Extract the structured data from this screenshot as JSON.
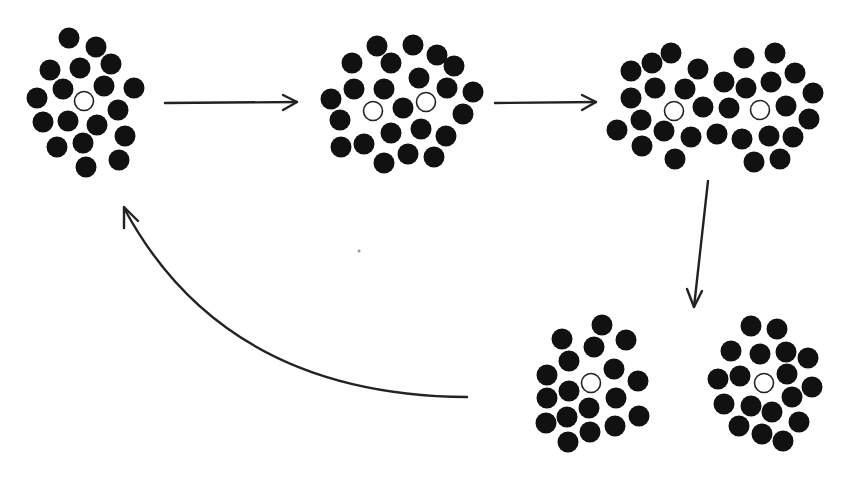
{
  "diagram": {
    "colors": {
      "particle": "#111111",
      "hole": "#ffffff",
      "stroke": "#222222",
      "background": "#ffffff"
    },
    "particle_radius": 10.5,
    "hole_radius": 9.5,
    "clusters": [
      {
        "name": "cluster-1-single",
        "holes": [
          [
            84,
            101
          ]
        ],
        "particles": [
          [
            69,
            38
          ],
          [
            96,
            47
          ],
          [
            50,
            70
          ],
          [
            80,
            68
          ],
          [
            111,
            64
          ],
          [
            63,
            89
          ],
          [
            104,
            86
          ],
          [
            134,
            88
          ],
          [
            37,
            98
          ],
          [
            118,
            110
          ],
          [
            43,
            122
          ],
          [
            68,
            121
          ],
          [
            97,
            125
          ],
          [
            125,
            136
          ],
          [
            57,
            147
          ],
          [
            83,
            143
          ],
          [
            86,
            167
          ],
          [
            119,
            160
          ]
        ]
      },
      {
        "name": "cluster-2-two-holes",
        "holes": [
          [
            373,
            111
          ],
          [
            426,
            102
          ]
        ],
        "particles": [
          [
            377,
            46
          ],
          [
            413,
            45
          ],
          [
            352,
            63
          ],
          [
            391,
            63
          ],
          [
            437,
            55
          ],
          [
            454,
            66
          ],
          [
            419,
            78
          ],
          [
            354,
            89
          ],
          [
            384,
            89
          ],
          [
            447,
            88
          ],
          [
            473,
            92
          ],
          [
            331,
            99
          ],
          [
            403,
            108
          ],
          [
            463,
            114
          ],
          [
            340,
            120
          ],
          [
            391,
            133
          ],
          [
            421,
            129
          ],
          [
            446,
            136
          ],
          [
            341,
            147
          ],
          [
            364,
            144
          ],
          [
            408,
            154
          ],
          [
            434,
            157
          ],
          [
            384,
            163
          ]
        ]
      },
      {
        "name": "cluster-3-double",
        "holes": [
          [
            674,
            111
          ],
          [
            760,
            110
          ]
        ],
        "particles": [
          [
            671,
            53
          ],
          [
            652,
            63
          ],
          [
            631,
            71
          ],
          [
            698,
            69
          ],
          [
            744,
            58
          ],
          [
            775,
            53
          ],
          [
            795,
            73
          ],
          [
            655,
            88
          ],
          [
            685,
            89
          ],
          [
            724,
            82
          ],
          [
            746,
            88
          ],
          [
            771,
            82
          ],
          [
            813,
            93
          ],
          [
            631,
            98
          ],
          [
            703,
            107
          ],
          [
            729,
            108
          ],
          [
            786,
            106
          ],
          [
            809,
            119
          ],
          [
            641,
            120
          ],
          [
            617,
            130
          ],
          [
            664,
            131
          ],
          [
            691,
            137
          ],
          [
            717,
            134
          ],
          [
            742,
            139
          ],
          [
            769,
            136
          ],
          [
            793,
            137
          ],
          [
            642,
            146
          ],
          [
            675,
            159
          ],
          [
            754,
            162
          ],
          [
            780,
            159
          ]
        ]
      },
      {
        "name": "cluster-4-split-left",
        "holes": [
          [
            591,
            383
          ]
        ],
        "particles": [
          [
            602,
            325
          ],
          [
            562,
            339
          ],
          [
            594,
            347
          ],
          [
            626,
            340
          ],
          [
            569,
            361
          ],
          [
            614,
            369
          ],
          [
            547,
            375
          ],
          [
            638,
            381
          ],
          [
            569,
            391
          ],
          [
            547,
            398
          ],
          [
            616,
            398
          ],
          [
            589,
            408
          ],
          [
            639,
            416
          ],
          [
            567,
            417
          ],
          [
            546,
            423
          ],
          [
            615,
            426
          ],
          [
            590,
            432
          ],
          [
            568,
            442
          ]
        ]
      },
      {
        "name": "cluster-5-split-right",
        "holes": [
          [
            764,
            383
          ]
        ],
        "particles": [
          [
            751,
            326
          ],
          [
            777,
            329
          ],
          [
            731,
            351
          ],
          [
            760,
            354
          ],
          [
            786,
            352
          ],
          [
            808,
            358
          ],
          [
            718,
            379
          ],
          [
            740,
            376
          ],
          [
            787,
            374
          ],
          [
            812,
            387
          ],
          [
            724,
            404
          ],
          [
            751,
            406
          ],
          [
            792,
            397
          ],
          [
            772,
            412
          ],
          [
            799,
            422
          ],
          [
            739,
            426
          ],
          [
            762,
            434
          ],
          [
            783,
            441
          ]
        ]
      }
    ],
    "arrows": [
      {
        "name": "arrow-1-to-2",
        "path": "M165,103 L297,102",
        "head": "M283,95 L297,102 L283,110"
      },
      {
        "name": "arrow-2-to-3",
        "path": "M495,103 L596,102",
        "head": "M582,95 L596,102 L582,110"
      },
      {
        "name": "arrow-3-to-split",
        "path": "M708,181 L694,307",
        "head": "M687,289 L694,307 L702,291"
      },
      {
        "name": "arrow-return-curve",
        "path": "M467,397 C330,396 200,350 124,208",
        "head": "M124,228 L124,207 L138,221"
      }
    ],
    "specks": [
      [
        359,
        251
      ]
    ]
  }
}
